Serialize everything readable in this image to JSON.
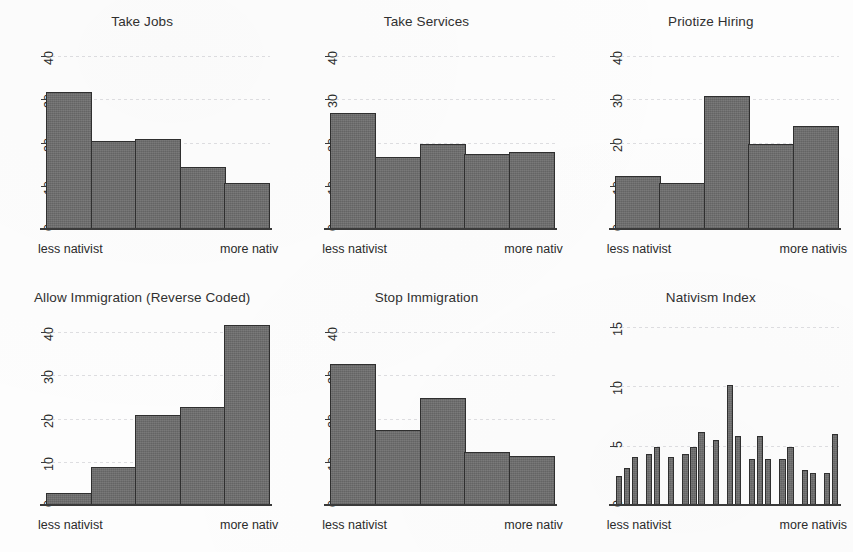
{
  "figure": {
    "background_color": "#fdfdfd",
    "bar_fill_color": "#6d6d6d",
    "bar_edge_color": "#2f2f2f",
    "axis_color": "#3a3a3a",
    "rows": 2,
    "cols": 3
  },
  "chart_data": [
    {
      "type": "bar",
      "title": "Take Jobs",
      "xlabel_left": "less nativist",
      "xlabel_right": "more nativ",
      "ylabel": "",
      "categories": [
        "1",
        "2",
        "3",
        "4",
        "5"
      ],
      "values": [
        32,
        20.5,
        21,
        14.5,
        11
      ],
      "ylim": [
        0,
        44
      ],
      "yticks": [
        0,
        10,
        20,
        30,
        40
      ],
      "grid": true,
      "legend": "none",
      "bars_contiguous": true
    },
    {
      "type": "bar",
      "title": "Take Services",
      "xlabel_left": "less nativist",
      "xlabel_right": "more nativ",
      "ylabel": "",
      "categories": [
        "1",
        "2",
        "3",
        "4",
        "5"
      ],
      "values": [
        27,
        17,
        20,
        17.5,
        18
      ],
      "ylim": [
        0,
        44
      ],
      "yticks": [
        0,
        10,
        20,
        30,
        40
      ],
      "grid": true,
      "legend": "none",
      "bars_contiguous": true
    },
    {
      "type": "bar",
      "title": "Priotize Hiring",
      "xlabel_left": "less nativist",
      "xlabel_right": "more nativis",
      "ylabel": "",
      "categories": [
        "1",
        "2",
        "3",
        "4",
        "5"
      ],
      "values": [
        12.5,
        11,
        31,
        20,
        24
      ],
      "ylim": [
        0,
        44
      ],
      "yticks": [
        0,
        10,
        20,
        30,
        40
      ],
      "grid": true,
      "legend": "none",
      "bars_contiguous": true
    },
    {
      "type": "bar",
      "title": "Allow Immigration (Reverse Coded)",
      "xlabel_left": "less nativist",
      "xlabel_right": "more nativ",
      "ylabel": "",
      "categories": [
        "1",
        "2",
        "3",
        "4",
        "5"
      ],
      "values": [
        3,
        9,
        21,
        23,
        42
      ],
      "ylim": [
        0,
        44
      ],
      "yticks": [
        0,
        10,
        20,
        30,
        40
      ],
      "grid": true,
      "legend": "none",
      "bars_contiguous": true
    },
    {
      "type": "bar",
      "title": "Stop Immigration",
      "xlabel_left": "less nativist",
      "xlabel_right": "more nativ",
      "ylabel": "",
      "categories": [
        "1",
        "2",
        "3",
        "4",
        "5"
      ],
      "values": [
        33,
        17.5,
        25,
        12.5,
        11.5
      ],
      "ylim": [
        0,
        44
      ],
      "yticks": [
        0,
        10,
        20,
        30,
        40
      ],
      "grid": true,
      "legend": "none",
      "bars_contiguous": true
    },
    {
      "type": "bar",
      "title": "Nativism Index",
      "xlabel_left": "less nativist",
      "xlabel_right": "more nativis",
      "ylabel": "",
      "categories": [
        "1",
        "2",
        "3",
        "4",
        "5",
        "6",
        "7",
        "8",
        "9",
        "10",
        "11",
        "12",
        "13",
        "14",
        "15",
        "16",
        "17",
        "18",
        "19",
        "20",
        "21",
        "22",
        "23",
        "24",
        "25",
        "26",
        "27",
        "28",
        "29"
      ],
      "values": [
        2.5,
        3.2,
        4.1,
        0,
        4.4,
        5.0,
        0,
        4.1,
        0,
        4.4,
        5.0,
        6.2,
        0,
        5.6,
        0,
        10.2,
        5.9,
        0,
        4.0,
        5.9,
        4.0,
        0,
        4.0,
        5.0,
        0,
        3.0,
        2.8,
        0,
        2.8,
        6.1
      ],
      "ylim": [
        0,
        16
      ],
      "yticks": [
        0,
        5,
        10,
        15
      ],
      "grid": true,
      "legend": "none",
      "bars_contiguous": false
    }
  ]
}
